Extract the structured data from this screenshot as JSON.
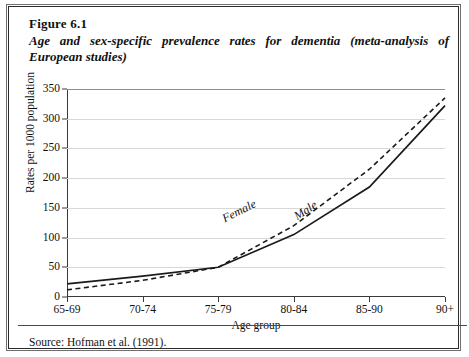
{
  "figure": {
    "number": "Figure 6.1",
    "title": "Age and sex-specific prevalence rates for dementia (meta-analysis of European studies)",
    "source": "Source: Hofman et al. (1991)."
  },
  "chart_data": {
    "type": "line",
    "title": "Age and sex-specific prevalence rates for dementia (meta-analysis of European studies)",
    "xlabel": "Age group",
    "ylabel": "Rates per 1000 population",
    "categories": [
      "65-69",
      "70-74",
      "75-79",
      "80-84",
      "85-90",
      "90+"
    ],
    "ylim": [
      0,
      350
    ],
    "yticks": [
      0,
      50,
      100,
      150,
      200,
      250,
      300,
      350
    ],
    "ytick_labels": [
      "0",
      "50",
      "100",
      "150",
      "200",
      "250",
      "300",
      "350"
    ],
    "grid": true,
    "legend": "inline-labels",
    "series": [
      {
        "name": "Female",
        "style": "dashed",
        "color": "#1a1a1a",
        "values": [
          12,
          28,
          50,
          120,
          215,
          335
        ]
      },
      {
        "name": "Male",
        "style": "solid",
        "color": "#1a1a1a",
        "values": [
          22,
          35,
          50,
          105,
          185,
          322
        ]
      }
    ],
    "annotations": [
      {
        "text": "Female"
      },
      {
        "text": "Male"
      }
    ]
  }
}
